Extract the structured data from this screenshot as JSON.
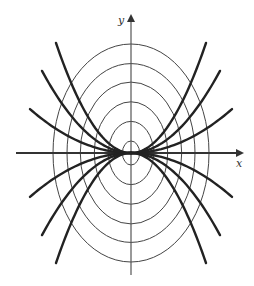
{
  "figure": {
    "x_axis_label": "x",
    "y_axis_label": "y",
    "ellipse_family": {
      "equation": "x^2 + 2y^2 = c",
      "count": 6,
      "relative_sizes": [
        1,
        0.82,
        0.65,
        0.47,
        0.29,
        0.11
      ]
    },
    "trajectory_family": {
      "equation": "y = k x^2",
      "k_values_relative": [
        1.0,
        0.53,
        0.22,
        -0.22,
        -0.53,
        -1.0
      ]
    },
    "colors": {
      "ellipse": "#444444",
      "trajectory": "#222222",
      "axis": "#333333"
    }
  }
}
